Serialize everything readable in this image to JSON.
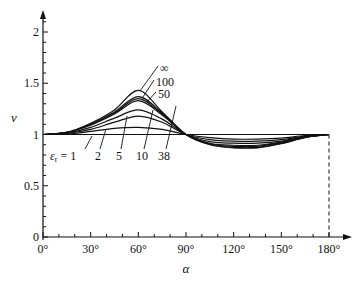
{
  "chart_data": {
    "type": "line",
    "title": "",
    "xlabel": "α",
    "ylabel": "v",
    "xlim": [
      0,
      180
    ],
    "ylim": [
      0,
      2.2
    ],
    "x_ticks": [
      "0°",
      "30°",
      "60°",
      "90°",
      "120°",
      "150°",
      "180°"
    ],
    "y_ticks": [
      "0",
      "0.5",
      "1",
      "1.5",
      "2"
    ],
    "grid": false,
    "legend_prefix": "εr = ",
    "x": [
      0,
      15,
      30,
      45,
      60,
      75,
      90,
      105,
      120,
      135,
      150,
      165,
      180
    ],
    "series": [
      {
        "name": "1",
        "values": [
          1,
          1,
          1,
          1,
          1,
          1,
          1,
          1,
          1,
          1,
          1,
          1,
          1
        ]
      },
      {
        "name": "2",
        "values": [
          1,
          1.005,
          1.03,
          1.06,
          1.07,
          1.05,
          1.0,
          0.97,
          0.955,
          0.955,
          0.965,
          0.99,
          1
        ]
      },
      {
        "name": "5",
        "values": [
          1,
          1.01,
          1.05,
          1.12,
          1.18,
          1.12,
          1.0,
          0.95,
          0.935,
          0.935,
          0.95,
          0.985,
          1
        ]
      },
      {
        "name": "10",
        "values": [
          1,
          1.015,
          1.07,
          1.16,
          1.24,
          1.15,
          1.0,
          0.93,
          0.915,
          0.915,
          0.935,
          0.98,
          1
        ]
      },
      {
        "name": "38",
        "values": [
          1,
          1.02,
          1.09,
          1.2,
          1.33,
          1.19,
          1.0,
          0.915,
          0.895,
          0.895,
          0.925,
          0.975,
          1
        ]
      },
      {
        "name": "50",
        "values": [
          1,
          1.02,
          1.1,
          1.21,
          1.35,
          1.2,
          1.0,
          0.91,
          0.885,
          0.885,
          0.92,
          0.975,
          1
        ]
      },
      {
        "name": "100",
        "values": [
          1,
          1.02,
          1.1,
          1.22,
          1.37,
          1.21,
          1.0,
          0.905,
          0.875,
          0.875,
          0.915,
          0.972,
          1
        ]
      },
      {
        "name": "∞",
        "values": [
          1,
          1.02,
          1.11,
          1.24,
          1.43,
          1.22,
          1.0,
          0.9,
          0.87,
          0.87,
          0.91,
          0.97,
          1
        ]
      }
    ],
    "annotations": [
      "εr = 1",
      "2",
      "5",
      "10",
      "38",
      "50",
      "100",
      "∞"
    ],
    "vertical_dashed_line_at": 180
  }
}
